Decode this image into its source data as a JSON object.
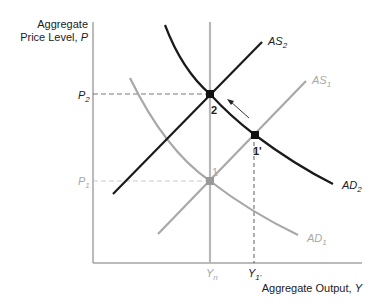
{
  "axes": {
    "y_label_line1": "Aggregate",
    "y_label_line2": "Price Level, ",
    "y_label_var": "P",
    "x_label": "Aggregate Output, ",
    "x_label_var": "Y"
  },
  "ticks": {
    "p2": "P",
    "p2_sub": "2",
    "p1": "P",
    "p1_sub": "1",
    "yn": "Y",
    "yn_sub": "n",
    "y1p": "Y",
    "y1p_sub": "1'"
  },
  "curves": {
    "as2": {
      "name": "AS",
      "sub": "2",
      "color": "#1a1a1a"
    },
    "as1": {
      "name": "AS",
      "sub": "1",
      "color": "#a8a8a8"
    },
    "ad2": {
      "name": "AD",
      "sub": "2",
      "color": "#1a1a1a"
    },
    "ad1": {
      "name": "AD",
      "sub": "1",
      "color": "#a8a8a8"
    },
    "ltas_color": "#b8b8b8"
  },
  "points": {
    "p1": "1",
    "p2": "2",
    "p1prime": "1'"
  },
  "colors": {
    "black_curve": "#1a1a1a",
    "gray_curve": "#a8a8a8",
    "axis": "#777777"
  }
}
